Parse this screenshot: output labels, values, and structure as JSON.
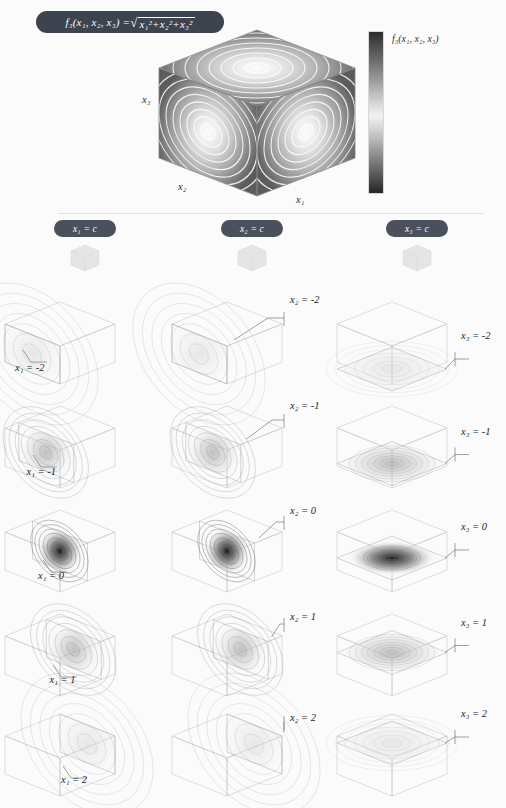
{
  "figure": {
    "title_formula": "f₃(x₁, x₂, x₃) =",
    "formula_radicand": "x₁²+x₂²+x₃²",
    "formula_plain": "f3(x1, x2, x3) = sqrt(x1^2 + x2^2 + x3^2)",
    "background": "#fbfbfb",
    "badge_color": "#3d4450",
    "header_badge_color": "#4a515c"
  },
  "hero": {
    "name": "isosurface-cube",
    "axis_labels": {
      "x1": "x₁",
      "x2": "x₂",
      "x3": "x₃"
    },
    "description": "Cube with concentric elliptical contour bands on three visible faces"
  },
  "colorbar": {
    "label": "f₃(x₁, x₂, x₃)",
    "orientation": "vertical",
    "stops": [
      "#2b2b2b",
      "#6e6e6e",
      "#bcbcbc",
      "#f2f2f2",
      "#bcbcbc",
      "#6e6e6e",
      "#262626"
    ]
  },
  "columns": [
    {
      "id": "col-x1",
      "badge": "x₁ = c",
      "label_side": "left"
    },
    {
      "id": "col-x2",
      "badge": "x₂ = c",
      "label_side": "right"
    },
    {
      "id": "col-x3",
      "badge": "x₃ = c",
      "label_side": "right"
    }
  ],
  "slices": {
    "x1": [
      {
        "label": "x₁ = -2",
        "c": -2,
        "intensity": 0.18,
        "spread": 1.0
      },
      {
        "label": "x₁ = -1",
        "c": -1,
        "intensity": 0.42,
        "spread": 0.62
      },
      {
        "label": "x₁ = 0",
        "c": 0,
        "intensity": 1.0,
        "spread": 0.34
      },
      {
        "label": "x₁ = 1",
        "c": 1,
        "intensity": 0.42,
        "spread": 0.62
      },
      {
        "label": "x₁ = 2",
        "c": 2,
        "intensity": 0.18,
        "spread": 1.0
      }
    ],
    "x2": [
      {
        "label": "x₂ = -2",
        "c": -2,
        "intensity": 0.18,
        "spread": 1.0
      },
      {
        "label": "x₂ = -1",
        "c": -1,
        "intensity": 0.42,
        "spread": 0.62
      },
      {
        "label": "x₂ = 0",
        "c": 0,
        "intensity": 1.0,
        "spread": 0.34
      },
      {
        "label": "x₂ = 1",
        "c": 1,
        "intensity": 0.42,
        "spread": 0.62
      },
      {
        "label": "x₂ = 2",
        "c": 2,
        "intensity": 0.18,
        "spread": 1.0
      }
    ],
    "x3": [
      {
        "label": "x₃ = -2",
        "c": -2,
        "intensity": 0.18,
        "spread": 1.0
      },
      {
        "label": "x₃ = -1",
        "c": -1,
        "intensity": 0.42,
        "spread": 0.62
      },
      {
        "label": "x₃ = 0",
        "c": 0,
        "intensity": 1.0,
        "spread": 0.34
      },
      {
        "label": "x₃ = 1",
        "c": 1,
        "intensity": 0.42,
        "spread": 0.62
      },
      {
        "label": "x₃ = 2",
        "c": 2,
        "intensity": 0.18,
        "spread": 1.0
      }
    ]
  },
  "chart_data": {
    "type": "heatmap",
    "xlabel": "x₁",
    "ylabel": "x₂",
    "zlabel": "x₃",
    "domain": [
      -2,
      2
    ],
    "slice_values": [
      -2,
      -1,
      0,
      1,
      2
    ],
    "colorbar_label": "f₃(x₁, x₂, x₃)",
    "panel_rows": 5,
    "panel_cols": 3,
    "note": "Each row holds a constant-coordinate slice plane through the unit cube; contour density peaks at c = 0 where the radial function reaches its minimum."
  }
}
